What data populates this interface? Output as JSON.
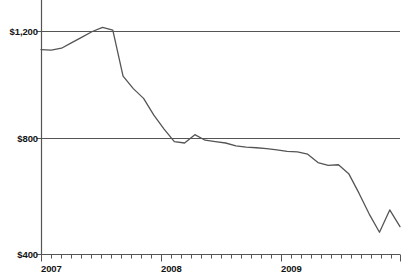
{
  "chart_data": {
    "type": "line",
    "title": "",
    "subtitle": "",
    "xlabel": "",
    "ylabel": "",
    "grid": "horizontal gridlines at $800 and $1,200, extending full plot width",
    "legend": "none",
    "line_color": "#555555",
    "axis_color": "#555555",
    "background_color": "#ffffff",
    "ylim": [
      400,
      1200
    ],
    "y_ticks": [
      400,
      800,
      1200
    ],
    "y_tick_labels": [
      "$400",
      "$800",
      "$1,200"
    ],
    "x_range": [
      "2007-01",
      "2009-12"
    ],
    "x_tick_interval": "monthly",
    "x_tick_labels": [
      "2007",
      "2008",
      "2009"
    ],
    "x": [
      "2007-01",
      "2007-02",
      "2007-03",
      "2007-04",
      "2007-05",
      "2007-06",
      "2007-07",
      "2007-08",
      "2007-09",
      "2007-10",
      "2007-11",
      "2007-12",
      "2008-01",
      "2008-02",
      "2008-03",
      "2008-04",
      "2008-05",
      "2008-06",
      "2008-07",
      "2008-08",
      "2008-09",
      "2008-10",
      "2008-11",
      "2008-12",
      "2009-01",
      "2009-02",
      "2009-03",
      "2009-04",
      "2009-05",
      "2009-06",
      "2009-07",
      "2009-08",
      "2009-09",
      "2009-10",
      "2009-11",
      "2009-12"
    ],
    "values": [
      1135,
      1133,
      1140,
      1160,
      1180,
      1200,
      1215,
      1205,
      1040,
      995,
      960,
      900,
      850,
      805,
      800,
      830,
      810,
      805,
      800,
      790,
      785,
      783,
      780,
      775,
      770,
      768,
      760,
      730,
      720,
      722,
      690,
      620,
      545,
      480,
      560,
      500
    ],
    "annotations": []
  },
  "axis": {
    "y_labels": [
      "$1,200",
      "$800",
      "$400"
    ],
    "x_labels": [
      "2007",
      "2008",
      "2009"
    ]
  }
}
